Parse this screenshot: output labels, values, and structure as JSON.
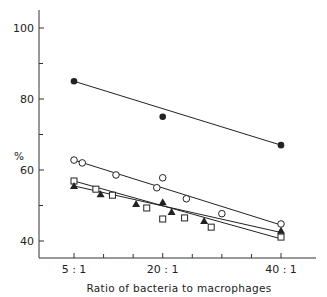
{
  "chart_data": {
    "type": "scatter",
    "title": "",
    "xlabel": "Ratio of bacteria to macrophages",
    "ylabel": "%",
    "xlim": [
      0,
      46
    ],
    "ylim": [
      35,
      105
    ],
    "x_ticks": [
      {
        "value": 5,
        "label": "5 : 1"
      },
      {
        "value": 20,
        "label": "20 : 1"
      },
      {
        "value": 40,
        "label": "40 : 1"
      }
    ],
    "x_minor_ticks": [
      10,
      15,
      25,
      30,
      35
    ],
    "y_ticks": [
      {
        "value": 40,
        "label": "40"
      },
      {
        "value": 60,
        "label": "60"
      },
      {
        "value": 80,
        "label": "80"
      },
      {
        "value": 100,
        "label": "100"
      }
    ],
    "y_minor_ticks": [
      50,
      70,
      90
    ],
    "grid": false,
    "legend": null,
    "series": [
      {
        "name": "filled circles",
        "marker": "filled-circle",
        "points": [
          [
            5,
            85
          ],
          [
            20,
            75
          ],
          [
            40,
            67
          ]
        ],
        "fit_line": [
          [
            5,
            85
          ],
          [
            40,
            67
          ]
        ]
      },
      {
        "name": "open circles",
        "marker": "open-circle",
        "points": [
          [
            5,
            62.8
          ],
          [
            6.4,
            62
          ],
          [
            12.1,
            58.6
          ],
          [
            19,
            55
          ],
          [
            20,
            57.8
          ],
          [
            24,
            51.9
          ],
          [
            30,
            47.7
          ],
          [
            40,
            44.8
          ]
        ],
        "fit_line": [
          [
            5,
            62.8
          ],
          [
            40,
            44.5
          ]
        ]
      },
      {
        "name": "open squares",
        "marker": "open-square",
        "points": [
          [
            5,
            56.9
          ],
          [
            8.7,
            54.6
          ],
          [
            11.5,
            52.9
          ],
          [
            17.3,
            49.3
          ],
          [
            20,
            46.2
          ],
          [
            23.7,
            46.5
          ],
          [
            28.2,
            43.9
          ],
          [
            40,
            41.1
          ]
        ],
        "fit_line": [
          [
            5,
            56.9
          ],
          [
            40,
            40.6
          ]
        ]
      },
      {
        "name": "filled triangles",
        "marker": "filled-triangle",
        "points": [
          [
            5,
            55.5
          ],
          [
            9.5,
            53.2
          ],
          [
            15.5,
            50.4
          ],
          [
            20,
            50.9
          ],
          [
            21.5,
            48.2
          ],
          [
            27,
            45.6
          ],
          [
            40,
            42.9
          ]
        ],
        "fit_line": [
          [
            5,
            55.5
          ],
          [
            40,
            42.4
          ]
        ]
      }
    ],
    "colors": {
      "ink": "#222222",
      "background": "#ffffff"
    }
  }
}
